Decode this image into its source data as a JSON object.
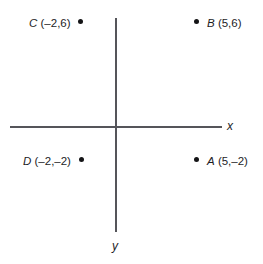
{
  "figure": {
    "background_color": "#ffffff",
    "axis_color": "#55555a",
    "point_color": "#141416",
    "text_color": "#1d1d1f"
  },
  "axes": {
    "x": {
      "label": "x",
      "orientation": "horizontal"
    },
    "y": {
      "label": "y",
      "orientation": "vertical"
    },
    "origin_shown": true,
    "tick_marks_shown": false,
    "grid_shown": false
  },
  "points": [
    {
      "id": "A",
      "name": "A",
      "coords_text": "(5,–2)",
      "full_label": "A (5,–2)",
      "x": 5,
      "y": -2,
      "quadrant": 4,
      "label_side": "right"
    },
    {
      "id": "B",
      "name": "B",
      "coords_text": "(5,6)",
      "full_label": "B (5,6)",
      "x": 5,
      "y": 6,
      "quadrant": 1,
      "label_side": "right"
    },
    {
      "id": "C",
      "name": "C",
      "coords_text": "(–2,6)",
      "full_label": "C (–2,6)",
      "x": -2,
      "y": 6,
      "quadrant": 2,
      "label_side": "left"
    },
    {
      "id": "D",
      "name": "D",
      "coords_text": "(–2,–2)",
      "full_label": "D (–2,–2)",
      "x": -2,
      "y": -2,
      "quadrant": 3,
      "label_side": "left"
    }
  ]
}
